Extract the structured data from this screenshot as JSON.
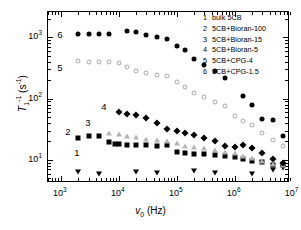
{
  "chart_data": {
    "type": "scatter",
    "title": "",
    "xlabel": "v0 (Hz)",
    "ylabel": "T1^-1 (s^-1)",
    "xscale": "log",
    "yscale": "log",
    "xlim": [
      600,
      9000000
    ],
    "ylim": [
      4.2,
      2600
    ],
    "grid": false,
    "legend_position": "top-right",
    "x_tick_labels": [
      "10",
      "10",
      "10",
      "10",
      "10"
    ],
    "x_tick_exponents": [
      "3",
      "4",
      "5",
      "6",
      "7"
    ],
    "x_tick_values": [
      1000,
      10000,
      100000,
      1000000,
      10000000
    ],
    "y_tick_labels": [
      "10",
      "10",
      "10"
    ],
    "y_tick_exponents": [
      "1",
      "2",
      "3"
    ],
    "y_tick_values": [
      10,
      100,
      1000
    ],
    "series": [
      {
        "name": "bulk 5CB",
        "key": "1",
        "marker": "tri-down-filled",
        "color": "#000000",
        "label_pos": {
          "x": 77,
          "y": 153
        },
        "points": [
          [
            2000,
            6.3
          ],
          [
            4600,
            5.9
          ],
          [
            20000,
            6.3
          ],
          [
            46000,
            6.2
          ],
          [
            200000,
            6.6
          ],
          [
            460000,
            6.2
          ],
          [
            2000000,
            5.9
          ],
          [
            4600000,
            6.9
          ],
          [
            6800000,
            7.4
          ]
        ]
      },
      {
        "name": "5CB+Bioran-100",
        "key": "2",
        "marker": "square-filled",
        "color": "#000000",
        "label_pos": {
          "x": 68,
          "y": 132
        },
        "points": [
          [
            2000,
            23
          ],
          [
            3000,
            25
          ],
          [
            4600,
            25
          ],
          [
            6800,
            19.5
          ],
          [
            8500,
            18.5
          ],
          [
            10000,
            18.0
          ],
          [
            14000,
            17.5
          ],
          [
            20000,
            17.2
          ],
          [
            30000,
            17.5
          ],
          [
            46000,
            17.0
          ],
          [
            68000,
            17.5
          ],
          [
            100000,
            13.5
          ],
          [
            140000,
            12.8
          ],
          [
            200000,
            12.5
          ],
          [
            300000,
            12.3
          ],
          [
            460000,
            12.0
          ],
          [
            680000,
            11.8
          ],
          [
            1000000,
            11.0
          ],
          [
            1400000,
            10.5
          ],
          [
            2000000,
            9.7
          ],
          [
            3000000,
            9.1
          ],
          [
            4600000,
            8.3
          ],
          [
            6800000,
            8.3
          ]
        ]
      },
      {
        "name": "5CB+Bioran-15",
        "key": "3",
        "marker": "tri-up-open",
        "color": "#b4b4b4",
        "label_pos": {
          "x": 88,
          "y": 123
        },
        "points": [
          [
            6800,
            28
          ],
          [
            10000,
            27
          ],
          [
            14000,
            25
          ],
          [
            20000,
            24
          ],
          [
            30000,
            22
          ],
          [
            46000,
            21
          ],
          [
            68000,
            20
          ],
          [
            100000,
            19
          ],
          [
            140000,
            17
          ],
          [
            200000,
            16.5
          ],
          [
            300000,
            15.5
          ],
          [
            460000,
            14.5
          ],
          [
            680000,
            13.5
          ],
          [
            1000000,
            12.8
          ],
          [
            1400000,
            11.8
          ],
          [
            2000000,
            10.8
          ],
          [
            3000000,
            9.6
          ],
          [
            4600000,
            8.6
          ],
          [
            6800000,
            8.3
          ]
        ]
      },
      {
        "name": "5CB+Bioran-5",
        "key": "4",
        "marker": "diamond-filled",
        "color": "#000000",
        "label_pos": {
          "x": 104,
          "y": 107
        },
        "points": [
          [
            10000,
            60
          ],
          [
            14000,
            57
          ],
          [
            20000,
            55
          ],
          [
            30000,
            48
          ],
          [
            46000,
            40
          ],
          [
            68000,
            32
          ],
          [
            100000,
            30
          ],
          [
            140000,
            28
          ],
          [
            200000,
            26
          ],
          [
            300000,
            23
          ],
          [
            460000,
            20
          ],
          [
            680000,
            17
          ],
          [
            1000000,
            16.5
          ],
          [
            1400000,
            17.5
          ],
          [
            2000000,
            15.5
          ],
          [
            3000000,
            13.0
          ],
          [
            4600000,
            10.5
          ],
          [
            6800000,
            9.0
          ]
        ]
      },
      {
        "name": "5CB+CPG-4",
        "key": "5",
        "marker": "circle-open",
        "color": "#a8a8a8",
        "label_pos": {
          "x": 60,
          "y": 68
        },
        "points": [
          [
            2000,
            410
          ],
          [
            3000,
            400
          ],
          [
            4600,
            400
          ],
          [
            6800,
            400
          ],
          [
            10000,
            380
          ],
          [
            14000,
            330
          ],
          [
            20000,
            280
          ],
          [
            30000,
            265
          ],
          [
            46000,
            240
          ],
          [
            68000,
            235
          ],
          [
            100000,
            185
          ],
          [
            140000,
            155
          ],
          [
            200000,
            125
          ],
          [
            300000,
            105
          ],
          [
            460000,
            87
          ],
          [
            680000,
            75
          ],
          [
            1000000,
            52
          ],
          [
            1400000,
            44
          ],
          [
            2000000,
            37
          ],
          [
            3000000,
            28
          ],
          [
            4600000,
            21
          ],
          [
            6800000,
            17
          ]
        ]
      },
      {
        "name": "5CB+CPG-1.5",
        "key": "6",
        "marker": "circle-filled",
        "color": "#000000",
        "label_pos": {
          "x": 60,
          "y": 35
        },
        "points": [
          [
            2000,
            1150
          ],
          [
            3000,
            1130
          ],
          [
            4600,
            1150
          ],
          [
            6800,
            1150
          ],
          [
            14000,
            1280
          ],
          [
            20000,
            1220
          ],
          [
            30000,
            1100
          ],
          [
            46000,
            1030
          ],
          [
            68000,
            950
          ],
          [
            100000,
            730
          ],
          [
            140000,
            620
          ],
          [
            200000,
            450
          ],
          [
            300000,
            350
          ],
          [
            460000,
            280
          ],
          [
            680000,
            215
          ],
          [
            1400000,
            110
          ],
          [
            2000000,
            78
          ],
          [
            3000000,
            47
          ],
          [
            4600000,
            45
          ],
          [
            6800000,
            25
          ]
        ]
      }
    ]
  },
  "legend": {
    "entries": [
      {
        "key": "1",
        "label": "bulk 5CB"
      },
      {
        "key": "2",
        "label": "5CB+Bioran-100"
      },
      {
        "key": "3",
        "label": "5CB+Bioran-15"
      },
      {
        "key": "4",
        "label": "5CB+Bioran-5"
      },
      {
        "key": "5",
        "label": "5CB+CPG-4"
      },
      {
        "key": "6",
        "label": "5CB+CPG-1.5"
      }
    ]
  }
}
